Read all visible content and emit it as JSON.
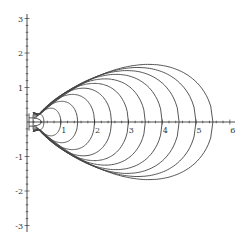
{
  "chart_data": {
    "type": "line",
    "title": "",
    "xlabel": "",
    "ylabel": "",
    "xlim": [
      0,
      6.1
    ],
    "ylim": [
      -3.1,
      3.1
    ],
    "grid": false,
    "legend": "none",
    "x_ticks": [
      1,
      2,
      3,
      4,
      5,
      6
    ],
    "x_tick_labels": [
      "1",
      "2",
      "3",
      "4",
      "5",
      "6"
    ],
    "y_ticks": [
      -3,
      -2,
      -1,
      1,
      2,
      3
    ],
    "y_tick_labels": [
      "-3",
      "-2",
      "-1",
      "1",
      "2",
      "3"
    ],
    "curve_family": {
      "description": "Symmetric egg-shaped closed curves about the x-axis, all converging near (0.18, ±0.27) on the left",
      "left_point": [
        0.18,
        0.27
      ],
      "series": [
        {
          "name": "c=0.5",
          "x_right": 0.5,
          "peak_y": 0.22
        },
        {
          "name": "c=1.0",
          "x_right": 1.0,
          "peak_y": 0.4
        },
        {
          "name": "c=1.5",
          "x_right": 1.5,
          "peak_y": 0.6
        },
        {
          "name": "c=2.0",
          "x_right": 2.0,
          "peak_y": 0.8
        },
        {
          "name": "c=2.5",
          "x_right": 2.5,
          "peak_y": 0.98
        },
        {
          "name": "c=3.0",
          "x_right": 3.0,
          "peak_y": 1.12
        },
        {
          "name": "c=3.5",
          "x_right": 3.5,
          "peak_y": 1.25
        },
        {
          "name": "c=4.0",
          "x_right": 4.0,
          "peak_y": 1.38
        },
        {
          "name": "c=4.5",
          "x_right": 4.5,
          "peak_y": 1.49
        },
        {
          "name": "c=5.0",
          "x_right": 5.0,
          "peak_y": 1.58
        },
        {
          "name": "c=5.5",
          "x_right": 5.5,
          "peak_y": 1.67
        }
      ]
    }
  }
}
